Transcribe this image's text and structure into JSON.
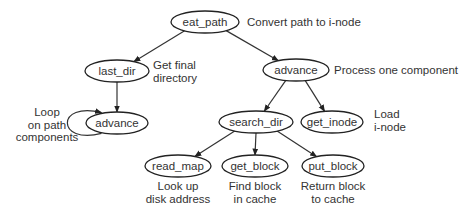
{
  "diagram": {
    "nodes": [
      {
        "id": "eat_path",
        "label": "eat_path",
        "note": [
          "Convert path to i-node"
        ]
      },
      {
        "id": "last_dir",
        "label": "last_dir",
        "note": [
          "Get final",
          "directory"
        ]
      },
      {
        "id": "advance_main",
        "label": "advance",
        "note": [
          "Process one component"
        ]
      },
      {
        "id": "advance_loop",
        "label": "advance",
        "note": [
          "Loop",
          "on path",
          "components"
        ]
      },
      {
        "id": "search_dir",
        "label": "search_dir",
        "note": []
      },
      {
        "id": "get_inode",
        "label": "get_inode",
        "note": [
          "Load",
          "i-node"
        ]
      },
      {
        "id": "read_map",
        "label": "read_map",
        "note": [
          "Look up",
          "disk address"
        ]
      },
      {
        "id": "get_block",
        "label": "get_block",
        "note": [
          "Find block",
          "in cache"
        ]
      },
      {
        "id": "put_block",
        "label": "put_block",
        "note": [
          "Return block",
          "to cache"
        ]
      }
    ],
    "edges": [
      {
        "from": "eat_path",
        "to": "last_dir"
      },
      {
        "from": "eat_path",
        "to": "advance_main"
      },
      {
        "from": "last_dir",
        "to": "advance_loop"
      },
      {
        "from": "advance_loop",
        "to": "advance_loop"
      },
      {
        "from": "advance_main",
        "to": "search_dir"
      },
      {
        "from": "advance_main",
        "to": "get_inode"
      },
      {
        "from": "search_dir",
        "to": "read_map"
      },
      {
        "from": "search_dir",
        "to": "get_block"
      },
      {
        "from": "search_dir",
        "to": "put_block"
      }
    ]
  }
}
